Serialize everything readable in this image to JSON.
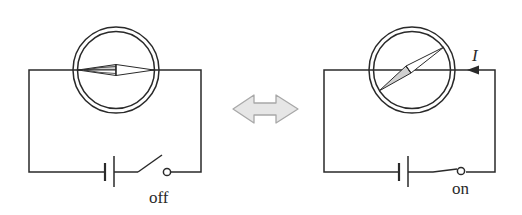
{
  "diagram": {
    "colors": {
      "line": "#2a2a2a",
      "needle_fill": "#d0d0d0",
      "arrow_fill": "#e6e6e6",
      "arrow_stroke": "#a8a8a8",
      "background": "#ffffff"
    },
    "left_circuit": {
      "state": "off",
      "switch_label": "off",
      "needle": "aligned with wire (no deflection)"
    },
    "right_circuit": {
      "state": "on",
      "switch_label": "on",
      "current_label": "I",
      "needle": "deflected by current"
    },
    "middle_arrow": {
      "icon": "double-headed-arrow-icon",
      "meaning": "comparison between off and on states"
    }
  }
}
